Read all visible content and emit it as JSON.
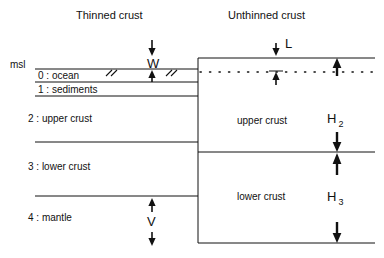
{
  "titles": {
    "left": "Thinned crust",
    "right": "Unthinned crust"
  },
  "labels": {
    "msl": "msl"
  },
  "left_layers": [
    {
      "id": "0",
      "label": "0 : ocean"
    },
    {
      "id": "1",
      "label": "1 : sediments"
    },
    {
      "id": "2",
      "label": "2 : upper crust"
    },
    {
      "id": "3",
      "label": "3 : lower crust"
    },
    {
      "id": "4",
      "label": "4 : mantle"
    }
  ],
  "right_layers": [
    {
      "id": "upper",
      "label": "upper crust"
    },
    {
      "id": "lower",
      "label": "lower crust"
    }
  ],
  "dimensions": [
    {
      "id": "w",
      "symbol": "W",
      "subscript": ""
    },
    {
      "id": "v",
      "symbol": "V",
      "subscript": ""
    },
    {
      "id": "l",
      "symbol": "L",
      "subscript": ""
    },
    {
      "id": "h2",
      "symbol": "H",
      "subscript": "2"
    },
    {
      "id": "h3",
      "symbol": "H",
      "subscript": "3"
    }
  ],
  "colors": {
    "ink": "#111111",
    "background": "#ffffff"
  }
}
